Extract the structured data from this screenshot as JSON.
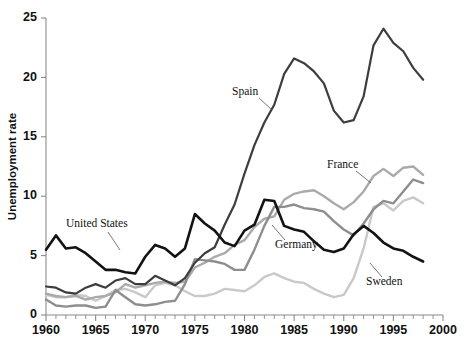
{
  "chart_data": {
    "type": "line",
    "title": "",
    "xlabel": "",
    "ylabel": "Unemployment rate",
    "xlim": [
      1960,
      2000
    ],
    "ylim": [
      0,
      25
    ],
    "ytick_labels": [
      "0",
      "5",
      "10",
      "15",
      "20",
      "25"
    ],
    "yticks": [
      0,
      5,
      10,
      15,
      20,
      25
    ],
    "xtick_labels": [
      "1960",
      "1965",
      "1970",
      "1975",
      "1980",
      "1985",
      "1990",
      "1995",
      "2000"
    ],
    "xticks": [
      1960,
      1965,
      1970,
      1975,
      1980,
      1985,
      1990,
      1995,
      2000
    ],
    "minor_xticks_every": 1,
    "grid": false,
    "legend_position": "inline-annotations",
    "x": [
      1960,
      1961,
      1962,
      1963,
      1964,
      1965,
      1966,
      1967,
      1968,
      1969,
      1970,
      1971,
      1972,
      1973,
      1974,
      1975,
      1976,
      1977,
      1978,
      1979,
      1980,
      1981,
      1982,
      1983,
      1984,
      1985,
      1986,
      1987,
      1988,
      1989,
      1990,
      1991,
      1992,
      1993,
      1994,
      1995,
      1996,
      1997,
      1998
    ],
    "series": [
      {
        "name": "United States",
        "color": "#131313",
        "width": 2.6,
        "values": [
          5.5,
          6.7,
          5.6,
          5.7,
          5.2,
          4.5,
          3.8,
          3.8,
          3.6,
          3.5,
          4.9,
          5.9,
          5.6,
          4.9,
          5.6,
          8.5,
          7.7,
          7.1,
          6.1,
          5.8,
          7.1,
          7.6,
          9.7,
          9.6,
          7.5,
          7.2,
          7.0,
          6.2,
          5.5,
          5.3,
          5.6,
          6.8,
          7.5,
          6.9,
          6.1,
          5.6,
          5.4,
          4.9,
          4.5
        ]
      },
      {
        "name": "Spain",
        "color": "#3d3d3d",
        "width": 2.2,
        "values": [
          2.4,
          2.3,
          1.9,
          1.8,
          2.3,
          2.6,
          2.3,
          2.9,
          3.1,
          2.6,
          2.6,
          3.3,
          2.9,
          2.5,
          3.1,
          4.4,
          5.2,
          5.7,
          7.6,
          9.3,
          11.9,
          14.3,
          16.2,
          17.7,
          20.3,
          21.6,
          21.2,
          20.5,
          19.5,
          17.2,
          16.2,
          16.4,
          18.4,
          22.7,
          24.1,
          22.9,
          22.2,
          20.8,
          19.8
        ]
      },
      {
        "name": "Germany",
        "color": "#8e8e8e",
        "width": 2.4,
        "values": [
          1.3,
          0.8,
          0.7,
          0.8,
          0.8,
          0.6,
          0.7,
          2.1,
          1.5,
          0.9,
          0.8,
          0.9,
          1.1,
          1.2,
          2.6,
          4.7,
          4.6,
          4.5,
          4.3,
          3.8,
          3.8,
          5.5,
          7.5,
          9.1,
          9.1,
          9.3,
          9.0,
          8.9,
          8.7,
          7.9,
          7.2,
          6.7,
          7.7,
          8.9,
          9.6,
          9.4,
          10.4,
          11.4,
          11.1
        ]
      },
      {
        "name": "France",
        "color": "#aaaaaa",
        "width": 2.4,
        "values": [
          1.8,
          1.6,
          1.5,
          1.6,
          1.3,
          1.5,
          1.6,
          1.9,
          2.6,
          2.3,
          2.5,
          2.7,
          2.8,
          2.7,
          2.8,
          4.0,
          4.4,
          4.9,
          5.2,
          5.9,
          6.3,
          7.4,
          8.1,
          8.3,
          9.7,
          10.2,
          10.4,
          10.5,
          10.0,
          9.4,
          8.9,
          9.5,
          10.4,
          11.7,
          12.3,
          11.7,
          12.4,
          12.5,
          11.8
        ]
      },
      {
        "name": "Sweden",
        "color": "#c9c9c9",
        "width": 2.4,
        "values": [
          1.7,
          1.5,
          1.5,
          1.7,
          1.6,
          1.2,
          1.6,
          2.1,
          2.2,
          1.9,
          1.5,
          2.5,
          2.7,
          2.5,
          2.0,
          1.6,
          1.6,
          1.8,
          2.2,
          2.1,
          2.0,
          2.5,
          3.2,
          3.5,
          3.1,
          2.8,
          2.7,
          2.2,
          1.8,
          1.5,
          1.7,
          3.1,
          5.6,
          9.1,
          9.4,
          8.8,
          9.6,
          9.9,
          9.4
        ]
      }
    ],
    "annotations": [
      {
        "label": "United States",
        "x": 66,
        "y": 227,
        "lx1": 108,
        "ly1": 232,
        "lx2": 120,
        "ly2": 250
      },
      {
        "label": "Spain",
        "x": 232,
        "y": 95,
        "lx1": 259,
        "ly1": 98,
        "lx2": 272,
        "ly2": 110
      },
      {
        "label": "France",
        "x": 327,
        "y": 168,
        "lx1": 356,
        "ly1": 171,
        "lx2": 371,
        "ly2": 183
      },
      {
        "label": "Germany",
        "x": 275,
        "y": 248,
        "lx1": 285,
        "ly1": 240,
        "lx2": 272,
        "ly2": 225
      },
      {
        "label": "Sweden",
        "x": 366,
        "y": 285,
        "lx1": 382,
        "ly1": 277,
        "lx2": 370,
        "ly2": 263
      }
    ]
  }
}
